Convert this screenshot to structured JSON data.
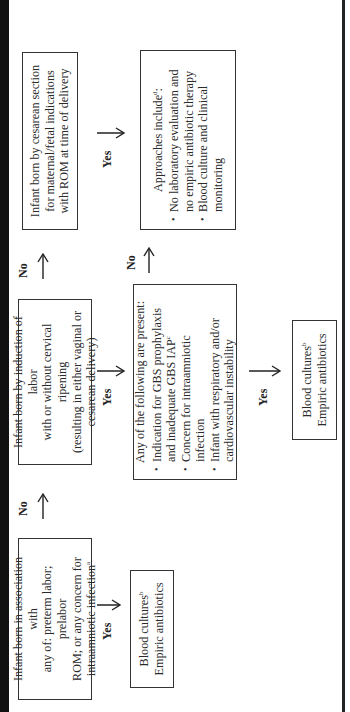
{
  "flowchart": {
    "orientation": "rotated -90deg (reads bottom to top)",
    "column1": {
      "decision": {
        "text_lines": [
          "Infant born in association with",
          "any of: preterm labor; prelabor",
          "ROM; or any concern for",
          "intraamniotic infection"
        ],
        "footnote": "a"
      },
      "yes_label": "Yes",
      "no_label": "No",
      "outcome": {
        "line1": "Blood cultures",
        "line1_footnote": "b",
        "line2": "Empiric antibiotics"
      }
    },
    "column2": {
      "decision": {
        "text_lines": [
          "Infant born by induction of labor",
          "with or without cervical ripening",
          "(resulting in either vaginal or",
          "cesarean delivery)"
        ]
      },
      "yes_label": "Yes",
      "criteria": {
        "heading": "Any of the following are present:",
        "items": [
          {
            "text": "Indication for GBS prophylaxis and inadequate GBS IAP",
            "footnote": "c"
          },
          {
            "text": "Concern for intraamniotic infection",
            "footnote": ""
          },
          {
            "text": "Infant with respiratory and/or cardiovascular instability",
            "footnote": ""
          }
        ]
      },
      "criteria_yes_label": "Yes",
      "no_label": "No",
      "criteria_no_label": "No",
      "outcome": {
        "line1": "Blood cultures",
        "line1_footnote": "b",
        "line2": "Empiric antibiotics"
      }
    },
    "column3": {
      "decision": {
        "text_lines": [
          "Infant born by cesarean section",
          "for maternal/fetal indications",
          "with ROM at time of delivery"
        ]
      },
      "yes_label": "Yes",
      "approaches": {
        "heading": "Approaches include",
        "heading_footnote": "d",
        "heading_suffix": ":",
        "items": [
          {
            "text": "No laboratory evaluation and no empiric antibiotic therapy"
          },
          {
            "text": "Blood culture and clinical monitoring"
          }
        ]
      }
    },
    "colors": {
      "text": "#2a2a2a",
      "border": "#333333",
      "background": "#ffffff",
      "edge_band": "#111111"
    }
  }
}
